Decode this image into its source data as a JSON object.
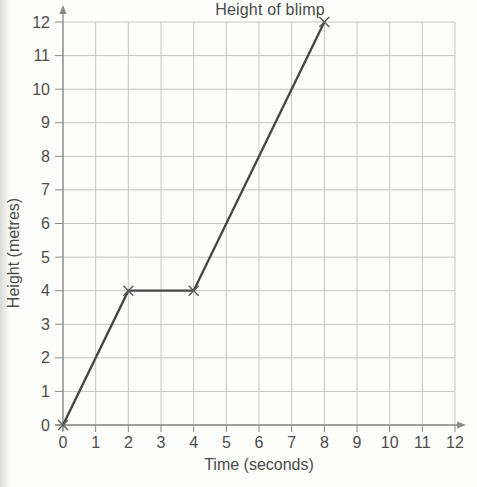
{
  "chart_data": {
    "type": "line",
    "title": "Height of blimp",
    "xlabel": "Time (seconds)",
    "ylabel": "Height (metres)",
    "xlim": [
      0,
      12
    ],
    "ylim": [
      0,
      12
    ],
    "xticks": [
      0,
      1,
      2,
      3,
      4,
      5,
      6,
      7,
      8,
      9,
      10,
      11,
      12
    ],
    "yticks": [
      0,
      1,
      2,
      3,
      4,
      5,
      6,
      7,
      8,
      9,
      10,
      11,
      12
    ],
    "grid": true,
    "legend": false,
    "marker": "x",
    "series": [
      {
        "name": "blimp-height",
        "points": [
          [
            0,
            0
          ],
          [
            2,
            4
          ],
          [
            4,
            4
          ],
          [
            8,
            12
          ]
        ]
      }
    ],
    "colors": {
      "grid": "#c5c5c4",
      "axis": "#8a8a8a",
      "tick": "#8a8a8a",
      "tick_label": "#4d4d4d",
      "line": "#474747",
      "marker": "#5a5a5a",
      "text": "#4a4a4a",
      "background": "#fdfdfc"
    }
  }
}
